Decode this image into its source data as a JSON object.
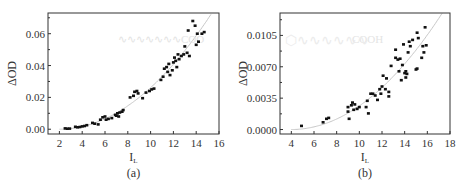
{
  "chart_data": [
    {
      "type": "scatter",
      "panel_label": "(a)",
      "title": "",
      "xlabel": "I_L",
      "ylabel": "ΔOD",
      "xlim": [
        1,
        16
      ],
      "ylim": [
        -0.003,
        0.073
      ],
      "xticks": [
        2,
        4,
        6,
        8,
        10,
        12,
        14,
        16
      ],
      "yticks": [
        "0.00",
        "0.02",
        "0.04",
        "0.06"
      ],
      "grid": false,
      "annotation": "…COO (faint molecular structure watermark)",
      "fit_curve": "quadratic",
      "series": [
        {
          "name": "data",
          "points": [
            [
              2.5,
              0.0005
            ],
            [
              2.7,
              0.0003
            ],
            [
              2.9,
              0.0004
            ],
            [
              3.4,
              0.0015
            ],
            [
              3.6,
              0.0012
            ],
            [
              3.8,
              0.0014
            ],
            [
              4.0,
              0.0018
            ],
            [
              4.2,
              0.002
            ],
            [
              4.4,
              0.0025
            ],
            [
              4.9,
              0.004
            ],
            [
              5.1,
              0.0035
            ],
            [
              5.4,
              0.003
            ],
            [
              5.6,
              0.006
            ],
            [
              5.8,
              0.0075
            ],
            [
              6.0,
              0.008
            ],
            [
              6.1,
              0.006
            ],
            [
              6.3,
              0.0065
            ],
            [
              6.6,
              0.007
            ],
            [
              6.9,
              0.009
            ],
            [
              7.0,
              0.0085
            ],
            [
              7.1,
              0.01
            ],
            [
              7.2,
              0.008
            ],
            [
              7.3,
              0.0105
            ],
            [
              7.5,
              0.011
            ],
            [
              7.6,
              0.012
            ],
            [
              8.2,
              0.02
            ],
            [
              8.5,
              0.021
            ],
            [
              8.6,
              0.0235
            ],
            [
              8.8,
              0.024
            ],
            [
              8.9,
              0.0225
            ],
            [
              9.3,
              0.0195
            ],
            [
              9.6,
              0.023
            ],
            [
              9.9,
              0.024
            ],
            [
              10.1,
              0.025
            ],
            [
              10.3,
              0.0255
            ],
            [
              10.9,
              0.031
            ],
            [
              11.1,
              0.033
            ],
            [
              11.2,
              0.038
            ],
            [
              11.4,
              0.039
            ],
            [
              11.5,
              0.036
            ],
            [
              11.6,
              0.041
            ],
            [
              11.7,
              0.034
            ],
            [
              11.9,
              0.037
            ],
            [
              12.0,
              0.042
            ],
            [
              12.1,
              0.045
            ],
            [
              12.2,
              0.043
            ],
            [
              12.3,
              0.039
            ],
            [
              12.4,
              0.047
            ],
            [
              12.5,
              0.044
            ],
            [
              12.7,
              0.046
            ],
            [
              12.9,
              0.047
            ],
            [
              13.0,
              0.052
            ],
            [
              13.2,
              0.048
            ],
            [
              13.3,
              0.062
            ],
            [
              13.4,
              0.046
            ],
            [
              13.7,
              0.068
            ],
            [
              13.9,
              0.065
            ],
            [
              14.0,
              0.053
            ],
            [
              14.1,
              0.06
            ],
            [
              14.2,
              0.055
            ],
            [
              14.5,
              0.06
            ],
            [
              14.7,
              0.061
            ]
          ]
        }
      ]
    },
    {
      "type": "scatter",
      "panel_label": "(b)",
      "title": "",
      "xlabel": "I_L",
      "ylabel": "ΔOD",
      "xlim": [
        3,
        18
      ],
      "ylim": [
        -0.0005,
        0.013
      ],
      "xticks": [
        4,
        6,
        8,
        10,
        12,
        14,
        16,
        18
      ],
      "yticks": [
        "0.0000",
        "0.0035",
        "0.0070",
        "0.0105"
      ],
      "grid": false,
      "annotation": "COOH (faint molecular structure watermark)",
      "fit_curve": "quadratic",
      "series": [
        {
          "name": "data",
          "points": [
            [
              4.9,
              0.0004
            ],
            [
              6.8,
              0.0008
            ],
            [
              7.1,
              0.0012
            ],
            [
              7.3,
              0.0013
            ],
            [
              9.0,
              0.0025
            ],
            [
              9.0,
              0.002
            ],
            [
              9.1,
              0.0012
            ],
            [
              9.3,
              0.0027
            ],
            [
              9.4,
              0.003
            ],
            [
              9.5,
              0.0022
            ],
            [
              9.6,
              0.0028
            ],
            [
              9.8,
              0.0023
            ],
            [
              10.0,
              0.0025
            ],
            [
              10.6,
              0.0025
            ],
            [
              10.7,
              0.0032
            ],
            [
              10.8,
              0.0018
            ],
            [
              11.0,
              0.004
            ],
            [
              11.2,
              0.004
            ],
            [
              11.4,
              0.0038
            ],
            [
              11.6,
              0.0033
            ],
            [
              11.8,
              0.0045
            ],
            [
              11.9,
              0.004
            ],
            [
              12.0,
              0.0048
            ],
            [
              12.1,
              0.006
            ],
            [
              12.3,
              0.0045
            ],
            [
              12.4,
              0.0057
            ],
            [
              12.6,
              0.0042
            ],
            [
              12.6,
              0.0037
            ],
            [
              12.8,
              0.0071
            ],
            [
              13.2,
              0.0089
            ],
            [
              13.2,
              0.008
            ],
            [
              13.4,
              0.0078
            ],
            [
              13.5,
              0.0065
            ],
            [
              13.6,
              0.0079
            ],
            [
              13.7,
              0.0055
            ],
            [
              13.8,
              0.0072
            ],
            [
              13.9,
              0.0095
            ],
            [
              14.0,
              0.0063
            ],
            [
              14.1,
              0.0065
            ],
            [
              14.1,
              0.0058
            ],
            [
              14.2,
              0.0062
            ],
            [
              14.3,
              0.0086
            ],
            [
              14.4,
              0.0098
            ],
            [
              14.5,
              0.0093
            ],
            [
              14.7,
              0.01
            ],
            [
              15.0,
              0.0067
            ],
            [
              15.1,
              0.0068
            ],
            [
              15.1,
              0.0108
            ],
            [
              15.2,
              0.0102
            ],
            [
              15.5,
              0.008
            ],
            [
              15.6,
              0.0093
            ],
            [
              15.7,
              0.0086
            ],
            [
              15.8,
              0.0114
            ],
            [
              15.9,
              0.0094
            ]
          ]
        }
      ]
    }
  ]
}
